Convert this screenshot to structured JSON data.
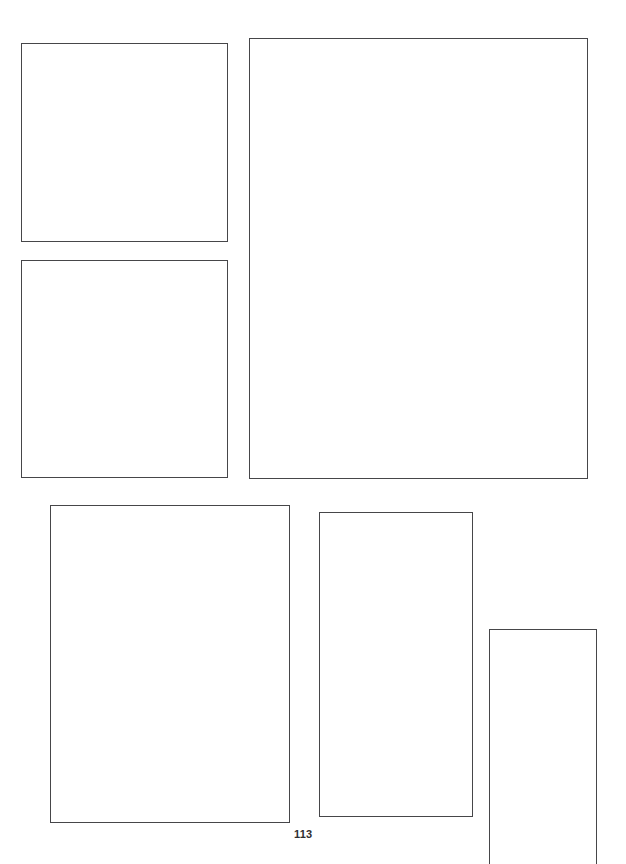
{
  "page": {
    "width": 626,
    "height": 864,
    "background_color": "#ffffff",
    "kind": "scanned-layout-page",
    "page_number": "113"
  },
  "style": {
    "frame_border_color": "#3b3b3d",
    "frame_fill_color": "#ffffff",
    "page_number_color": "#2f2f31"
  },
  "frames": [
    {
      "id": "frame-top-left",
      "label": "",
      "x": 21,
      "y": 43,
      "width": 207,
      "height": 199,
      "cut_off": false
    },
    {
      "id": "frame-top-right-large",
      "label": "",
      "x": 249,
      "y": 38,
      "width": 339,
      "height": 441,
      "cut_off": false
    },
    {
      "id": "frame-middle-left",
      "label": "",
      "x": 21,
      "y": 260,
      "width": 207,
      "height": 218,
      "cut_off": false
    },
    {
      "id": "frame-bottom-left",
      "label": "",
      "x": 50,
      "y": 505,
      "width": 240,
      "height": 318,
      "cut_off": false
    },
    {
      "id": "frame-bottom-middle",
      "label": "",
      "x": 319,
      "y": 512,
      "width": 154,
      "height": 305,
      "cut_off": false
    },
    {
      "id": "frame-bottom-right",
      "label": "",
      "x": 489,
      "y": 629,
      "width": 108,
      "height": 235,
      "cut_off": true
    }
  ],
  "page_number_position": {
    "x": 294,
    "y": 829
  }
}
